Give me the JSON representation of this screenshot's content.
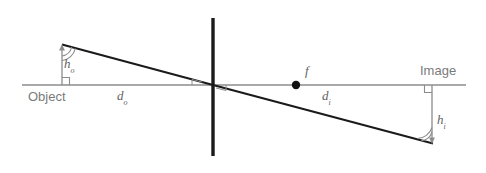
{
  "diagram": {
    "labels": {
      "object": "Object",
      "image": "Image",
      "object_distance": "d",
      "object_distance_sub": "o",
      "image_distance": "d",
      "image_distance_sub": "i",
      "object_height": "h",
      "object_height_sub": "o",
      "image_height": "h",
      "image_height_sub": "i",
      "focal_point": "f"
    },
    "colors": {
      "axis": "#8c8c8c",
      "lens": "#1a1a1a",
      "ray": "#1a1a1a",
      "arrow": "#8c8c8c",
      "text": "#7a7a7a",
      "math_text": "#5f5f5f",
      "focal_dot": "#111111",
      "background": "#ffffff"
    },
    "geometry": {
      "axis_y": 85,
      "axis_x_start": 22,
      "axis_x_end": 466,
      "lens_x": 213,
      "lens_y_top": 18,
      "lens_y_bottom": 156,
      "object_arrow_x": 62,
      "object_arrow_tip_y": 46,
      "image_arrow_x": 432,
      "image_arrow_tip_y": 143,
      "focal_point_x": 296,
      "focal_point_y": 85
    }
  }
}
